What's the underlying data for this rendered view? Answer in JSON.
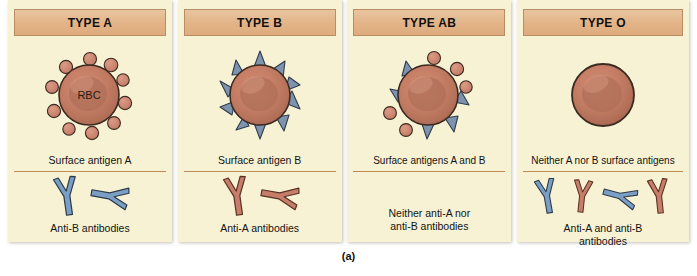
{
  "figure": {
    "label": "(a)",
    "colors": {
      "panel_background": "#f7f2d3",
      "header_background": "#e3b387",
      "header_border": "#b98d63",
      "divider": "#c08a52",
      "rbc_fill": "#c47e66",
      "rbc_center": "#b06a55",
      "rbc_outline": "#3b2a22",
      "antigen_a": "#cf8370",
      "antigen_b": "#7d93ae",
      "antibody_anti_a": "#c67e6a",
      "antibody_anti_b": "#7a9ec4",
      "text": "#131313"
    }
  },
  "panels": [
    {
      "id": "type-a",
      "title": "TYPE A",
      "cell_label": "RBC",
      "antigen_caption": "Surface antigen A",
      "antibody_caption": "Anti-B antibodies",
      "antigen_type": "a",
      "antigen_count": 10,
      "antibodies": [
        "anti-b",
        "anti-b"
      ]
    },
    {
      "id": "type-b",
      "title": "TYPE B",
      "cell_label": "",
      "antigen_caption": "Surface antigen B",
      "antibody_caption": "Anti-A antibodies",
      "antigen_type": "b",
      "antigen_count": 9,
      "antibodies": [
        "anti-a",
        "anti-a"
      ]
    },
    {
      "id": "type-ab",
      "title": "TYPE AB",
      "cell_label": "",
      "antigen_caption": "Surface antigens A and B",
      "antibody_caption": "Neither anti-A nor anti-B antibodies",
      "antibody_caption_line1": "Neither anti-A nor",
      "antibody_caption_line2": "anti-B antibodies",
      "antigen_type": "ab",
      "antigen_count": 10,
      "antibodies": []
    },
    {
      "id": "type-o",
      "title": "TYPE O",
      "cell_label": "",
      "antigen_caption": "Neither A nor B surface antigens",
      "antibody_caption": "Anti-A and anti-B antibodies",
      "antibody_caption_line1": "Anti-A and anti-B",
      "antibody_caption_line2": "antibodies",
      "antigen_type": "none",
      "antigen_count": 0,
      "antibodies": [
        "anti-b",
        "anti-a",
        "anti-b",
        "anti-a"
      ]
    }
  ]
}
